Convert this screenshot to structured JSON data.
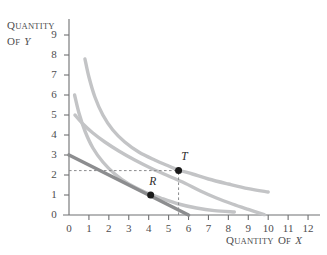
{
  "figure": {
    "background": "#ffffff",
    "axis_color": "#6f7072",
    "curve_color": "#c3c4c6",
    "budget_line_color": "#8c8d8f",
    "point_color": "#1a1a1a",
    "dash_color": "#8a8b8d"
  },
  "axes": {
    "y_title": {
      "first": "Q",
      "rest": "UANTITY",
      "of_first": "O",
      "of_rest": "F",
      "variable": "Y"
    },
    "x_title": {
      "first": "Q",
      "rest": "UANTITY",
      "of_first": "O",
      "of_rest": "F",
      "variable": "X"
    },
    "y_ticks": [
      "0",
      "1",
      "2",
      "3",
      "4",
      "5",
      "6",
      "7",
      "8",
      "9"
    ],
    "x_ticks": [
      "0",
      "1",
      "2",
      "3",
      "4",
      "5",
      "6",
      "7",
      "8",
      "9",
      "10",
      "11",
      "12"
    ]
  },
  "chart_data": {
    "type": "line",
    "title": "",
    "xlabel": "Quantity of X",
    "ylabel": "Quantity of Y",
    "xlim": [
      0,
      12.6
    ],
    "ylim": [
      0,
      9.6
    ],
    "grid": false,
    "legend": "none",
    "x_ticks": [
      0,
      1,
      2,
      3,
      4,
      5,
      6,
      7,
      8,
      9,
      10,
      11,
      12
    ],
    "y_ticks": [
      0,
      1,
      2,
      3,
      4,
      5,
      6,
      7,
      8,
      9
    ],
    "series": [
      {
        "name": "indifference-curve-outer",
        "style": "curve",
        "color": "#c3c4c6",
        "width": 3.4,
        "points": [
          [
            0.8,
            7.8
          ],
          [
            1.0,
            6.9
          ],
          [
            1.3,
            5.9
          ],
          [
            1.7,
            5.0
          ],
          [
            2.2,
            4.25
          ],
          [
            2.8,
            3.65
          ],
          [
            3.5,
            3.15
          ],
          [
            4.3,
            2.75
          ],
          [
            5.0,
            2.45
          ],
          [
            5.5,
            2.25
          ],
          [
            6.2,
            2.05
          ],
          [
            7.0,
            1.8
          ],
          [
            8.0,
            1.55
          ],
          [
            9.0,
            1.32
          ],
          [
            10.0,
            1.15
          ]
        ]
      },
      {
        "name": "indifference-curve-inner",
        "style": "curve",
        "color": "#c3c4c6",
        "width": 3.4,
        "points": [
          [
            0.3,
            5.0
          ],
          [
            0.7,
            4.55
          ],
          [
            1.2,
            4.1
          ],
          [
            1.8,
            3.65
          ],
          [
            2.5,
            3.2
          ],
          [
            3.3,
            2.75
          ],
          [
            4.2,
            2.3
          ],
          [
            5.0,
            1.95
          ],
          [
            5.8,
            1.6
          ],
          [
            6.6,
            1.2
          ],
          [
            7.4,
            0.85
          ],
          [
            8.2,
            0.55
          ],
          [
            9.0,
            0.28
          ],
          [
            9.8,
            0.02
          ]
        ]
      },
      {
        "name": "indifference-curve-lowest",
        "style": "curve",
        "color": "#c3c4c6",
        "width": 3.4,
        "points": [
          [
            0.28,
            6.0
          ],
          [
            0.5,
            5.1
          ],
          [
            0.8,
            4.2
          ],
          [
            1.2,
            3.35
          ],
          [
            1.7,
            2.65
          ],
          [
            2.3,
            2.05
          ],
          [
            3.0,
            1.55
          ],
          [
            3.8,
            1.15
          ],
          [
            4.6,
            0.85
          ],
          [
            5.5,
            0.55
          ],
          [
            6.4,
            0.35
          ],
          [
            7.3,
            0.22
          ],
          [
            8.3,
            0.15
          ]
        ]
      },
      {
        "name": "budget-line",
        "style": "line",
        "color": "#8c8d8f",
        "width": 3.6,
        "points": [
          [
            0.0,
            3.0
          ],
          [
            6.0,
            0.0
          ]
        ]
      }
    ],
    "points": [
      {
        "label": "T",
        "x": 5.5,
        "y": 2.22,
        "label_dx": 0.3,
        "label_dy": 0.62
      },
      {
        "label": "R",
        "x": 4.1,
        "y": 1.0,
        "label_dx": 0.1,
        "label_dy": 0.62
      }
    ],
    "guides": [
      {
        "name": "horizontal-dashed-to-T",
        "from": [
          0.0,
          2.22
        ],
        "to": [
          5.5,
          2.22
        ]
      },
      {
        "name": "vertical-dashed-to-T",
        "from": [
          5.5,
          0.0
        ],
        "to": [
          5.5,
          2.22
        ]
      }
    ]
  }
}
